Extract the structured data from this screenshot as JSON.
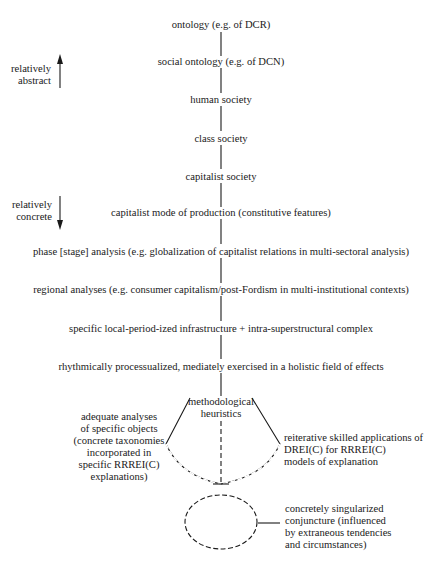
{
  "levels": [
    {
      "label": "ontology (e.g. of DCR)"
    },
    {
      "label": "social ontology (e.g. of DCN)"
    },
    {
      "label": "human society"
    },
    {
      "label": "class society"
    },
    {
      "label": "capitalist society"
    },
    {
      "label": "capitalist mode of production (constitutive features)"
    },
    {
      "label": "phase [stage] analysis (e.g. globalization of capitalist relations in multi-sectoral analysis)"
    },
    {
      "label": "regional analyses (e.g. consumer capitalism/post-Fordism in multi-institutional contexts)"
    },
    {
      "label": "specific local-period-ized infrastructure + intra-superstructural complex"
    },
    {
      "label": "rhythmically processualized, mediately exercised in a holistic field of effects"
    }
  ],
  "axis": {
    "abstract": {
      "line1": "relatively",
      "line2": "abstract",
      "direction": "up"
    },
    "concrete": {
      "line1": "relatively",
      "line2": "concrete",
      "direction": "down"
    }
  },
  "heuristics": {
    "center": {
      "line1": "methodological",
      "line2": "heuristics"
    },
    "left": {
      "line1": "adequate analyses",
      "line2": "of specific objects",
      "line3": "(concrete taxonomies",
      "line4": "incorporated in",
      "line5": "specific RRREI(C)",
      "line6": "explanations)"
    },
    "right": {
      "line1": "reiterative skilled applications of",
      "line2": "DREI(C) for RRREI(C)",
      "line3": "models of explanation"
    }
  },
  "conjuncture": {
    "line1": "concretely singularized",
    "line2": "conjuncture (influenced",
    "line3": "by extraneous tendencies",
    "line4": "and circumstances)"
  },
  "colors": {
    "ink": "#1a1a1a",
    "background": "#ffffff"
  }
}
